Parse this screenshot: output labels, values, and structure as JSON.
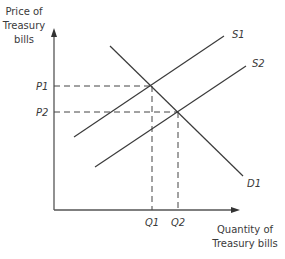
{
  "diagram": {
    "type": "supply-demand",
    "y_axis_label": [
      "Price of",
      "Treasury",
      "bills"
    ],
    "x_axis_label": [
      "Quantity of",
      "Treasury bills"
    ],
    "price_labels": {
      "p1": "P1",
      "p2": "P2"
    },
    "quantity_labels": {
      "q1": "Q1",
      "q2": "Q2"
    },
    "curve_labels": {
      "s1": "S1",
      "s2": "S2",
      "d1": "D1"
    },
    "colors": {
      "line": "#3a3a3a",
      "axis": "#555555",
      "text": "#3a3a3a"
    }
  }
}
